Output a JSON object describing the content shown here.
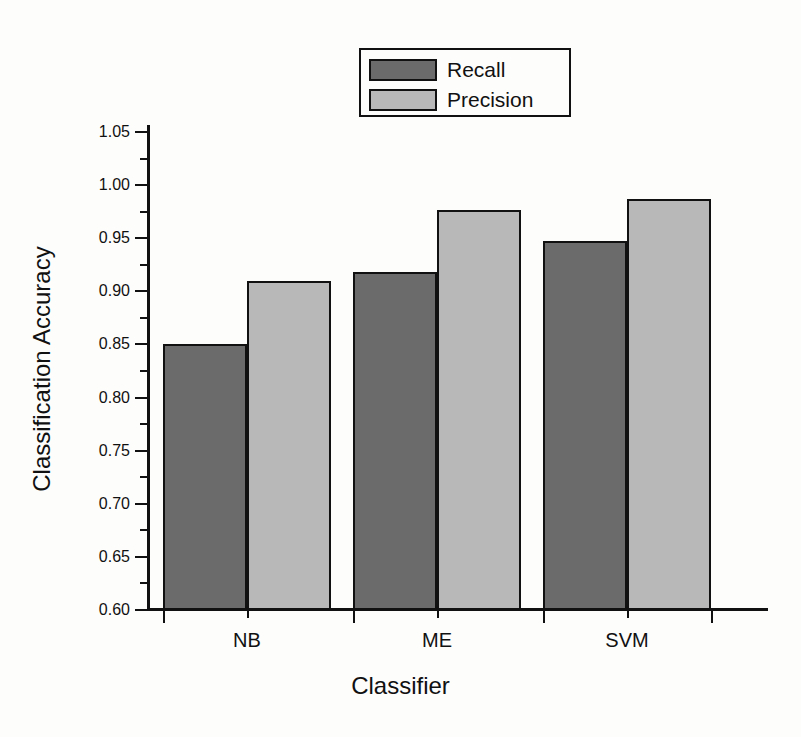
{
  "chart_data": {
    "type": "bar",
    "title": "",
    "subtitle": "",
    "xlabel": "Classifier",
    "ylabel": "Classification Accuracy",
    "categories": [
      "NB",
      "ME",
      "SVM"
    ],
    "series": [
      {
        "name": "Recall",
        "values": [
          0.85,
          0.918,
          0.947
        ],
        "color": "#6b6b6b"
      },
      {
        "name": "Precision",
        "values": [
          0.91,
          0.977,
          0.987
        ],
        "color": "#b8b8b8"
      }
    ],
    "ylim": [
      0.6,
      1.05
    ],
    "ytick_labels": [
      "1.05",
      "1.00",
      "0.95",
      "0.90",
      "0.85",
      "0.80",
      "0.75",
      "0.70",
      "0.65",
      "0.60"
    ],
    "ytick_values": [
      1.05,
      1.0,
      0.95,
      0.9,
      0.85,
      0.8,
      0.75,
      0.7,
      0.65,
      0.6
    ],
    "yminor_values": [
      1.025,
      0.975,
      0.925,
      0.875,
      0.825,
      0.775,
      0.725,
      0.675,
      0.625
    ],
    "grid": false,
    "legend_position": "top-center",
    "legend_entries": [
      "Recall",
      "Precision"
    ]
  }
}
